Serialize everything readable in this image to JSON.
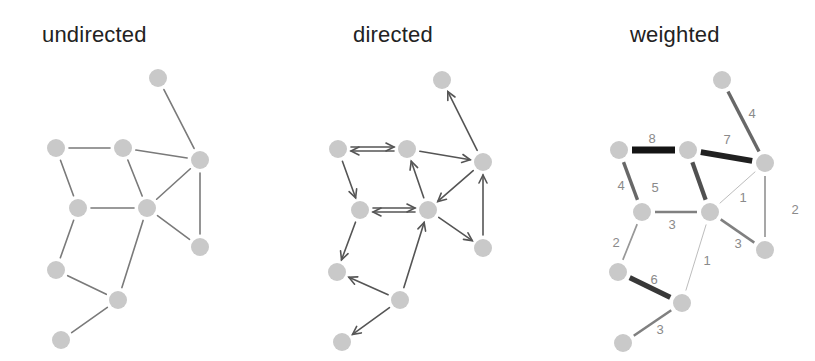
{
  "titles": {
    "undirected": "undirected",
    "directed": "directed",
    "weighted": "weighted"
  },
  "colors": {
    "node": "#c9c9c9",
    "edge": "#7a7a7a",
    "arrow": "#555555",
    "heavy_edge": "#1a1a1a",
    "label": "#8a8a8a"
  },
  "graphs": {
    "undirected": {
      "nodes": [
        [
          158,
          78
        ],
        [
          56,
          148
        ],
        [
          123,
          148
        ],
        [
          200,
          160
        ],
        [
          78,
          208
        ],
        [
          147,
          208
        ],
        [
          200,
          247
        ],
        [
          56,
          270
        ],
        [
          118,
          300
        ],
        [
          61,
          340
        ]
      ],
      "edges": [
        [
          0,
          3
        ],
        [
          1,
          2
        ],
        [
          2,
          3
        ],
        [
          1,
          4
        ],
        [
          2,
          5
        ],
        [
          3,
          5
        ],
        [
          3,
          6
        ],
        [
          4,
          5
        ],
        [
          5,
          6
        ],
        [
          4,
          7
        ],
        [
          5,
          8
        ],
        [
          7,
          8
        ],
        [
          8,
          9
        ]
      ]
    },
    "directed": {
      "nodes": [
        [
          442,
          80
        ],
        [
          338,
          149
        ],
        [
          407,
          149
        ],
        [
          483,
          162
        ],
        [
          360,
          210
        ],
        [
          428,
          210
        ],
        [
          483,
          248
        ],
        [
          337,
          272
        ],
        [
          400,
          300
        ],
        [
          342,
          342
        ]
      ],
      "edges": [
        {
          "from": 3,
          "to": 0
        },
        {
          "from": 1,
          "to": 2,
          "double": true
        },
        {
          "from": 2,
          "to": 3
        },
        {
          "from": 1,
          "to": 4
        },
        {
          "from": 5,
          "to": 2
        },
        {
          "from": 3,
          "to": 5
        },
        {
          "from": 6,
          "to": 3
        },
        {
          "from": 4,
          "to": 5,
          "double": true
        },
        {
          "from": 5,
          "to": 6
        },
        {
          "from": 4,
          "to": 7
        },
        {
          "from": 8,
          "to": 5
        },
        {
          "from": 8,
          "to": 7
        },
        {
          "from": 8,
          "to": 9
        }
      ]
    },
    "weighted": {
      "nodes": [
        [
          722,
          80
        ],
        [
          619,
          150
        ],
        [
          688,
          150
        ],
        [
          765,
          163
        ],
        [
          642,
          212
        ],
        [
          710,
          212
        ],
        [
          765,
          250
        ],
        [
          618,
          272
        ],
        [
          682,
          303
        ],
        [
          623,
          343
        ]
      ],
      "edges": [
        {
          "a": 0,
          "b": 3,
          "w": 4
        },
        {
          "a": 1,
          "b": 2,
          "w": 8
        },
        {
          "a": 2,
          "b": 3,
          "w": 7
        },
        {
          "a": 1,
          "b": 4,
          "w": 4
        },
        {
          "a": 2,
          "b": 5,
          "w": 5
        },
        {
          "a": 3,
          "b": 5,
          "w": 1
        },
        {
          "a": 3,
          "b": 6,
          "w": 2
        },
        {
          "a": 4,
          "b": 5,
          "w": 3
        },
        {
          "a": 5,
          "b": 6,
          "w": 3
        },
        {
          "a": 4,
          "b": 7,
          "w": 2
        },
        {
          "a": 5,
          "b": 8,
          "w": 1
        },
        {
          "a": 7,
          "b": 8,
          "w": 6
        },
        {
          "a": 8,
          "b": 9,
          "w": 3
        }
      ],
      "label_positions": [
        [
          752,
          118
        ],
        [
          652,
          143
        ],
        [
          727,
          144
        ],
        [
          621,
          190
        ],
        [
          655,
          192
        ],
        [
          743,
          202
        ],
        [
          795,
          214
        ],
        [
          672,
          229
        ],
        [
          738,
          248
        ],
        [
          616,
          247
        ],
        [
          707,
          265
        ],
        [
          654,
          284
        ],
        [
          660,
          334
        ]
      ]
    }
  }
}
